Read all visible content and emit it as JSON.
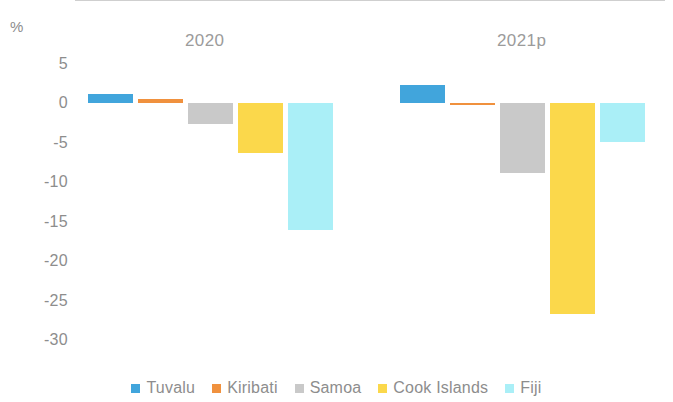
{
  "chart_data": {
    "type": "bar",
    "title": "",
    "subtitle": "",
    "xlabel": "",
    "ylabel": "%",
    "ylim": [
      -30,
      5
    ],
    "yticks": [
      5,
      0,
      -5,
      -10,
      -15,
      -20,
      -25,
      -30
    ],
    "ytick_labels": [
      "5",
      "0",
      "-5",
      "-10",
      "-15",
      "-20",
      "-25",
      "-30"
    ],
    "grid": false,
    "legend_position": "bottom",
    "categories": [
      "2020",
      "2021p"
    ],
    "series": [
      {
        "name": "Tuvalu",
        "color": "#41a5dc",
        "values": [
          1.1,
          2.3
        ]
      },
      {
        "name": "Kiribati",
        "color": "#f0913e",
        "values": [
          0.5,
          -0.3
        ]
      },
      {
        "name": "Samoa",
        "color": "#c9c9c9",
        "values": [
          -2.7,
          -8.9
        ]
      },
      {
        "name": "Cook Islands",
        "color": "#fbd84b",
        "values": [
          -6.3,
          -26.7
        ]
      },
      {
        "name": "Fiji",
        "color": "#aaeff7",
        "values": [
          -16.1,
          -4.9
        ]
      }
    ]
  },
  "axis": {
    "unit_label": "%"
  },
  "legend": {
    "items": [
      {
        "label": "Tuvalu"
      },
      {
        "label": "Kiribati"
      },
      {
        "label": "Samoa"
      },
      {
        "label": "Cook Islands"
      },
      {
        "label": "Fiji"
      }
    ]
  },
  "groups": [
    {
      "label": "2020"
    },
    {
      "label": "2021p"
    }
  ]
}
